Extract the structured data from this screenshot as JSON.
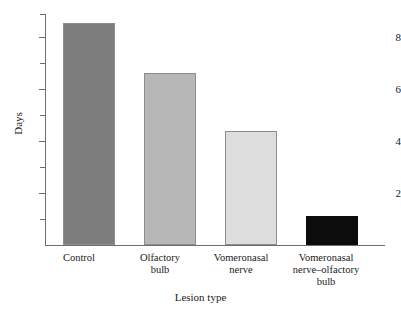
{
  "chart_data": {
    "type": "bar",
    "title": "",
    "xlabel": "Lesion type",
    "ylabel": "Days",
    "categories": [
      "Control",
      "Olfactory bulb",
      "Vomeronasal nerve",
      "Vomeronasal nerve–olfactory bulb"
    ],
    "values": [
      8.55,
      6.6,
      4.4,
      1.1
    ],
    "ylim": [
      0,
      8.9
    ],
    "ytick_labels": [
      "2",
      "4",
      "6",
      "8"
    ],
    "ytick_values": [
      2,
      4,
      6,
      8
    ],
    "yminor_values": [
      1,
      3,
      5,
      7
    ],
    "grid": false,
    "legend": false,
    "bar_colors": [
      "#7d7d7d",
      "#b7b7b7",
      "#dddddd",
      "#0c0c0c"
    ],
    "bar_border_color": "#8d8d8d"
  },
  "axes": {
    "y_title": "Days",
    "x_title": "Lesion type"
  },
  "ticks": {
    "major": [
      {
        "label": "2",
        "value": 2
      },
      {
        "label": "4",
        "value": 4
      },
      {
        "label": "6",
        "value": 6
      },
      {
        "label": "8",
        "value": 8
      }
    ]
  },
  "bars": [
    {
      "label_line1": "Control",
      "label_line2": "",
      "value": 8.55,
      "color": "#7d7d7d"
    },
    {
      "label_line1": "Olfactory",
      "label_line2": "bulb",
      "value": 6.6,
      "color": "#b7b7b7"
    },
    {
      "label_line1": "Vomeronasal",
      "label_line2": "nerve",
      "value": 4.4,
      "color": "#dddddd"
    },
    {
      "label_line1": "Vomeronasal",
      "label_line2": "nerve–olfactory",
      "label_line3": "bulb",
      "value": 1.1,
      "color": "#0c0c0c"
    }
  ]
}
